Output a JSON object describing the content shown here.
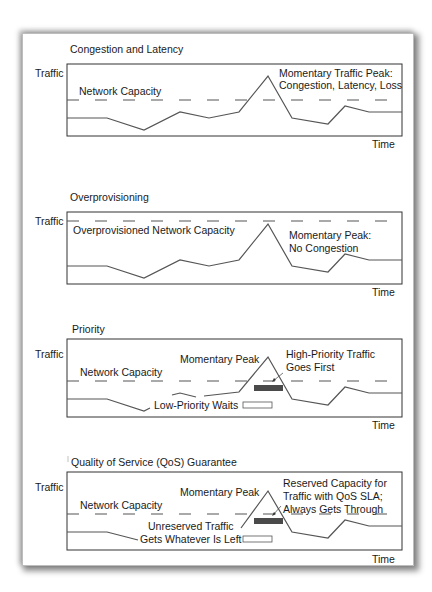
{
  "panels": [
    {
      "title": "Congestion and Latency",
      "y_label": "Traffic",
      "x_label": "Time",
      "capacity_label": "Network Capacity",
      "annotation": [
        "Momentary Traffic Peak:",
        "Congestion, Latency, Loss"
      ]
    },
    {
      "title": "Overprovisioning",
      "y_label": "Traffic",
      "x_label": "Time",
      "capacity_label": "Overprovisioned Network Capacity",
      "annotation": [
        "Momentary Peak:",
        "No Congestion"
      ]
    },
    {
      "title": "Priority",
      "y_label": "Traffic",
      "x_label": "Time",
      "capacity_label": "Network Capacity",
      "peak_label": "Momentary Peak",
      "annotation": [
        "High-Priority Traffic",
        "Goes First"
      ],
      "low_label": "Low-Priority Waits"
    },
    {
      "title": "Quality of Service (QoS) Guarantee",
      "y_label": "Traffic",
      "x_label": "Time",
      "capacity_label": "Network Capacity",
      "peak_label": "Momentary Peak",
      "annotation": [
        "Reserved Capacity for",
        "Traffic with QoS SLA;",
        "Always Gets Through"
      ],
      "low_label": [
        "Unreserved Traffic",
        "Gets Whatever Is Left"
      ]
    }
  ],
  "colors": {
    "line": "#555555",
    "dash": "#555555",
    "box": "#333333",
    "reserved_bar": "#4a4a4a"
  }
}
